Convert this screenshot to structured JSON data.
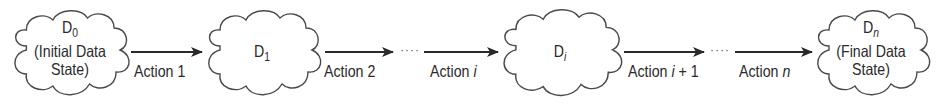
{
  "diagram": {
    "type": "state-transition-flow",
    "nodes": [
      {
        "id": "D0",
        "base": "D",
        "sub": "0",
        "sub_italic": false,
        "caption_line1": "(Initial Data",
        "caption_line2": "State)"
      },
      {
        "id": "D1",
        "base": "D",
        "sub": "1",
        "sub_italic": false
      },
      {
        "id": "Di",
        "base": "D",
        "sub": "i",
        "sub_italic": true
      },
      {
        "id": "Dn",
        "base": "D",
        "sub": "n",
        "sub_italic": true,
        "caption_line1": "(Final Data",
        "caption_line2": "State)"
      }
    ],
    "edges": [
      {
        "from": "D0",
        "to": "D1",
        "label_prefix": "Action ",
        "label_var": "",
        "label_suffix": "1"
      },
      {
        "from": "D1",
        "to": "...",
        "label_prefix": "Action ",
        "label_var": "",
        "label_suffix": "2"
      },
      {
        "from": "...",
        "to": "Di",
        "label_prefix": "Action ",
        "label_var": "i",
        "label_suffix": ""
      },
      {
        "from": "Di",
        "to": "...",
        "label_prefix": "Action ",
        "label_var": "i",
        "label_suffix": " + 1"
      },
      {
        "from": "...",
        "to": "Dn",
        "label_prefix": "Action ",
        "label_var": "n",
        "label_suffix": ""
      }
    ],
    "ellipsis": "····",
    "colors": {
      "stroke": "#4a4a4a",
      "arrow": "#2a2a2a",
      "text": "#2a2a2a"
    }
  }
}
